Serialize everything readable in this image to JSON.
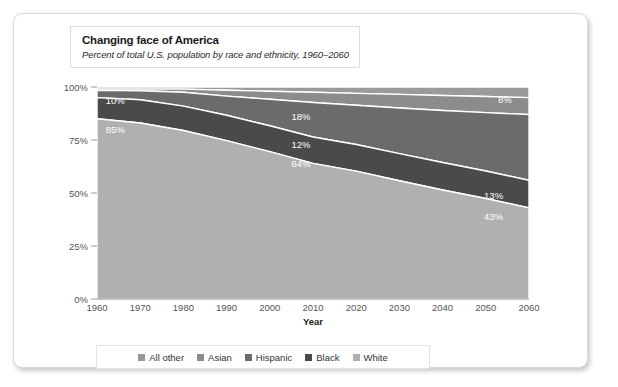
{
  "card": {
    "title": "Changing face of America",
    "subtitle": "Percent of total U.S. population by race and ethnicity, 1960–2060"
  },
  "colors": {
    "all_other": "#6e6e6e",
    "asian": "#8c8c8c",
    "hispanic": "#6b6b6b",
    "black": "#4a4a4a",
    "white": "#b0b0b0",
    "card_bg": "#ffffff",
    "axis_text": "#555555",
    "label_text": "#ffffff"
  },
  "legend": {
    "position": "bottom",
    "items": [
      {
        "label": "All other",
        "color": "#9a9a9a"
      },
      {
        "label": "Asian",
        "color": "#8c8c8c"
      },
      {
        "label": "Hispanic",
        "color": "#6b6b6b"
      },
      {
        "label": "Black",
        "color": "#4a4a4a"
      },
      {
        "label": "White",
        "color": "#b0b0b0"
      }
    ]
  },
  "chart_data": {
    "type": "area",
    "stacked": true,
    "title": "Changing face of America",
    "subtitle": "Percent of total U.S. population by race and ethnicity, 1960–2060",
    "xlabel": "Year",
    "ylabel": "",
    "xlim": [
      1960,
      2060
    ],
    "ylim": [
      0,
      100
    ],
    "grid": false,
    "x": [
      1960,
      1970,
      1980,
      1990,
      2000,
      2010,
      2020,
      2030,
      2040,
      2050,
      2060
    ],
    "xticklabels": [
      "1960",
      "1970",
      "1980",
      "1990",
      "2000",
      "2010",
      "2020",
      "2030",
      "2040",
      "2050",
      "2060"
    ],
    "yticklabels": [
      "0%",
      "25%",
      "50%",
      "75%",
      "100%"
    ],
    "yticks": [
      0,
      25,
      50,
      75,
      100
    ],
    "stack_order_top_to_bottom": [
      "All other",
      "Asian",
      "Hispanic",
      "Black",
      "White"
    ],
    "series": [
      {
        "name": "All other",
        "color": "#9a9a9a",
        "values": [
          1,
          1,
          1,
          1.5,
          2,
          2.5,
          3,
          3.5,
          4,
          4.5,
          5
        ]
      },
      {
        "name": "Asian",
        "color": "#8c8c8c",
        "values": [
          0.6,
          0.8,
          1.5,
          2.8,
          3.8,
          4.8,
          5.6,
          6.4,
          7.1,
          7.6,
          8
        ]
      },
      {
        "name": "Hispanic",
        "color": "#6b6b6b",
        "values": [
          3.4,
          4.2,
          6.5,
          9,
          12.5,
          16.3,
          18.5,
          21.5,
          24.5,
          27.5,
          31
        ]
      },
      {
        "name": "Black",
        "color": "#4a4a4a",
        "values": [
          10,
          11,
          11.5,
          12,
          12.2,
          12.4,
          12.6,
          12.8,
          13,
          13,
          13
        ]
      },
      {
        "name": "White",
        "color": "#b0b0b0",
        "values": [
          85,
          83,
          79.5,
          74.7,
          69.5,
          64,
          60.3,
          55.8,
          51.4,
          47.4,
          43
        ]
      }
    ],
    "annotations": [
      {
        "text": "10%",
        "series": "Black",
        "x": 1962,
        "y_pct": 93.5
      },
      {
        "text": "85%",
        "series": "White",
        "x": 1962,
        "y_pct": 80
      },
      {
        "text": "18%",
        "series": "Hispanic",
        "x": 2005,
        "y_pct": 86
      },
      {
        "text": "12%",
        "series": "Black",
        "x": 2005,
        "y_pct": 73
      },
      {
        "text": "64%",
        "series": "White",
        "x": 2005,
        "y_pct": 64
      },
      {
        "text": "8%",
        "series": "Asian",
        "x": 2056,
        "y_pct": 94
      },
      {
        "text": "13%",
        "series": "Black",
        "x": 2054,
        "y_pct": 49
      },
      {
        "text": "43%",
        "series": "White",
        "x": 2054,
        "y_pct": 39
      }
    ]
  }
}
